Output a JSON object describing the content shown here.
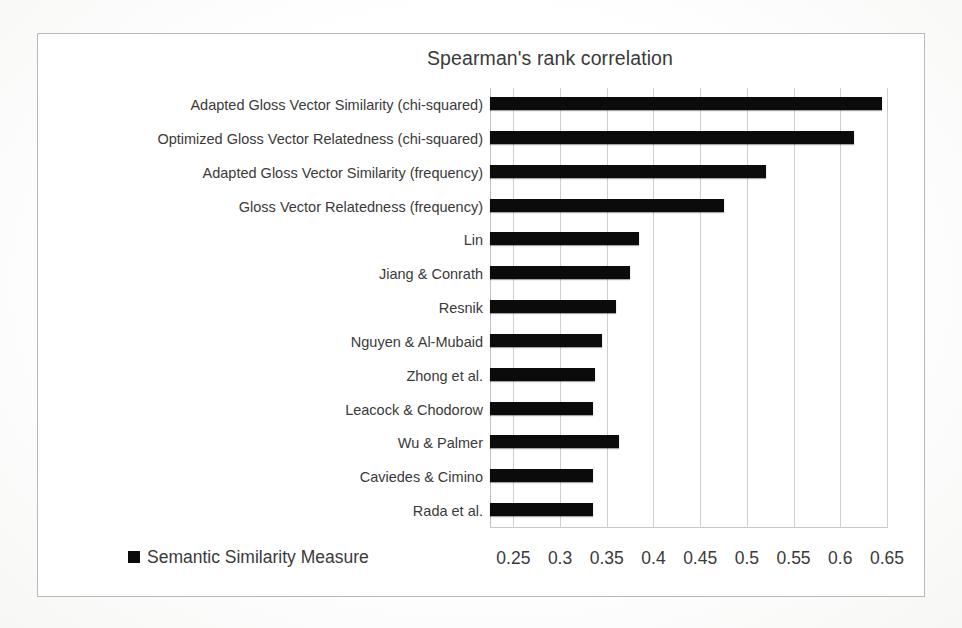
{
  "chart_data": {
    "type": "bar",
    "orientation": "horizontal",
    "title": "Spearman's rank correlation",
    "xlabel": "",
    "ylabel": "",
    "xlim": [
      0.225,
      0.65
    ],
    "xticks": [
      "0.25",
      "0.3",
      "0.35",
      "0.4",
      "0.45",
      "0.5",
      "0.55",
      "0.6",
      "0.65"
    ],
    "xtick_values": [
      0.25,
      0.3,
      0.35,
      0.4,
      0.45,
      0.5,
      0.55,
      0.6,
      0.65
    ],
    "grid": "vertical",
    "legend": [
      {
        "label": "Semantic Similarity Measure",
        "color": "#0b0b0b",
        "marker": "square"
      }
    ],
    "legend_position": "bottom-left",
    "bar_color": "#0b0b0b",
    "categories": [
      "Adapted Gloss Vector Similarity (chi-squared)",
      "Optimized Gloss Vector Relatedness (chi-squared)",
      "Adapted Gloss Vector Similarity (frequency)",
      "Gloss Vector Relatedness (frequency)",
      "Lin",
      "Jiang & Conrath",
      "Resnik",
      "Nguyen & Al-Mubaid",
      "Zhong et al.",
      "Leacock & Chodorow",
      "Wu & Palmer",
      "Caviedes & Cimino",
      "Rada et al."
    ],
    "values": [
      0.645,
      0.615,
      0.52,
      0.475,
      0.385,
      0.375,
      0.36,
      0.345,
      0.337,
      0.335,
      0.363,
      0.335,
      0.335
    ],
    "series": [
      {
        "name": "Semantic Similarity Measure",
        "values": [
          0.645,
          0.615,
          0.52,
          0.475,
          0.385,
          0.375,
          0.36,
          0.345,
          0.337,
          0.335,
          0.363,
          0.335,
          0.335
        ]
      }
    ]
  }
}
